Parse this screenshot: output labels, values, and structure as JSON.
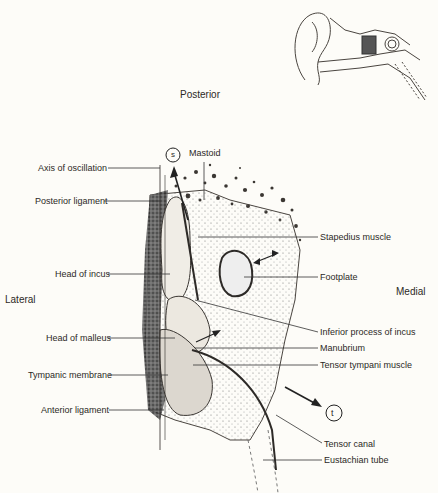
{
  "orientation": {
    "top": "Posterior",
    "left": "Lateral",
    "right": "Medial"
  },
  "markers": {
    "s": "s",
    "t": "t"
  },
  "labels_left": [
    "Axis of oscillation",
    "Posterior ligament",
    "Head of incus",
    "Head of malleus",
    "Tympanic membrane",
    "Anterior ligament"
  ],
  "labels_right": [
    "Mastoid",
    "Stapedius muscle",
    "Footplate",
    "Inferior process of incus",
    "Manubrium",
    "Tensor tympani muscle",
    "Tensor canal",
    "Eustachian tube"
  ],
  "inset": {
    "subject": "ear cross-section overview with middle ear highlighted"
  },
  "colors": {
    "background": "#fdfcf8",
    "ink": "#2a2724",
    "shade": "#6b6660"
  }
}
